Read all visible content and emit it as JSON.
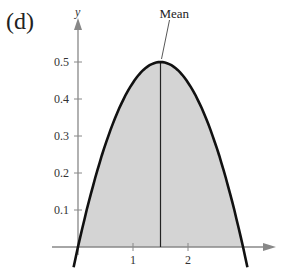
{
  "panel_label": "(d)",
  "chart_data": {
    "type": "area",
    "title": "",
    "function": "f(x) = (2/9) x (3 - x), 0 <= x <= 3",
    "x": [
      0,
      0.25,
      0.5,
      0.75,
      1,
      1.25,
      1.5,
      1.75,
      2,
      2.25,
      2.5,
      2.75,
      3
    ],
    "y": [
      0,
      0.153,
      0.278,
      0.375,
      0.444,
      0.486,
      0.5,
      0.486,
      0.444,
      0.375,
      0.278,
      0.153,
      0
    ],
    "xlabel": "",
    "ylabel": "y",
    "x_ticks": [
      1,
      2
    ],
    "x_tick_labels": [
      "1",
      "2"
    ],
    "y_ticks": [
      0.1,
      0.2,
      0.3,
      0.4,
      0.5
    ],
    "y_tick_labels": [
      "0.1",
      "0.2",
      "0.3",
      "0.4",
      "0.5"
    ],
    "xlim": [
      0,
      3.7
    ],
    "ylim": [
      0,
      0.6
    ],
    "grid": false,
    "shaded_region": {
      "from": 0,
      "to": 3,
      "color": "#d4d4d4"
    },
    "annotations": [
      {
        "text": "Mean",
        "x": 1.5,
        "y": 0.5,
        "vertical_line": true
      }
    ],
    "colors": {
      "curve": "#111111",
      "fill": "#d4d4d4",
      "axis": "#888888",
      "text": "#333333"
    }
  }
}
